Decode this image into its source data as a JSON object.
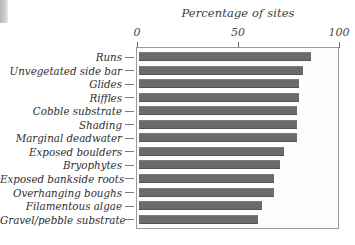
{
  "chart_data": {
    "type": "bar",
    "orientation": "horizontal",
    "title": "Percentage of sites",
    "xlabel": "",
    "ylabel": "",
    "xlim": [
      0,
      100
    ],
    "tick_labels": [
      "0",
      "50",
      "100"
    ],
    "tick_values": [
      0,
      50,
      100
    ],
    "grid": false,
    "legend": null,
    "bar_color": "#6b6b6b",
    "categories": [
      "Runs",
      "Unvegetated side bar",
      "Glides",
      "Riffles",
      "Cobble substrate",
      "Shading",
      "Marginal deadwater",
      "Exposed boulders",
      "Bryophytes",
      "Exposed bankside roots",
      "Overhanging boughs",
      "Filamentous algae",
      "Gravel/pebble substrate"
    ],
    "values": [
      86,
      82,
      80,
      80,
      79,
      79,
      79,
      73,
      71,
      68,
      68,
      62,
      60
    ]
  }
}
